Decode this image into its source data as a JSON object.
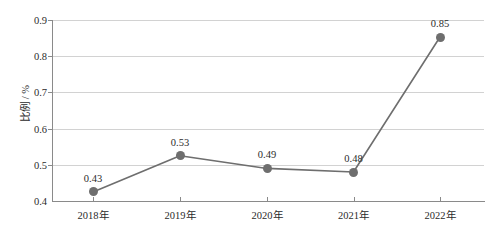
{
  "chart_data": {
    "type": "line",
    "title": "",
    "xlabel": "",
    "ylabel": "比例 / %",
    "categories": [
      "2018年",
      "2019年",
      "2020年",
      "2021年",
      "2022年"
    ],
    "values": [
      0.43,
      0.53,
      0.49,
      0.48,
      0.85
    ],
    "plotted_values": [
      0.425,
      0.525,
      0.49,
      0.48,
      0.853
    ],
    "point_labels": [
      "0.43",
      "0.53",
      "0.49",
      "0.48",
      "0.85"
    ],
    "ylim": [
      0.4,
      0.9
    ],
    "yticks": [
      0.4,
      0.5,
      0.6,
      0.7,
      0.8,
      0.9
    ],
    "ytick_labels": [
      "0.4",
      "0.5",
      "0.6",
      "0.7",
      "0.8",
      "0.9"
    ],
    "grid": true,
    "grid_axis": "y",
    "legend": false,
    "series": [
      {
        "name": "比例",
        "values": [
          0.43,
          0.53,
          0.49,
          0.48,
          0.85
        ],
        "line_color": "#6e6e6e",
        "marker_color": "#6e6e6e",
        "marker": "circle"
      }
    ],
    "colors": {
      "line": "#6e6e6e",
      "marker": "#6e6e6e",
      "grid": "#d2d2d2",
      "axis": "#8a8a8a",
      "text": "#2b2b2b",
      "background": "#ffffff"
    }
  }
}
